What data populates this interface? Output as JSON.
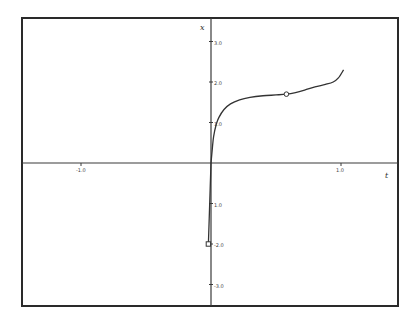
{
  "chart_data": {
    "type": "line",
    "title": "",
    "xlabel": "t",
    "ylabel": "x",
    "xlim": [
      -1.6,
      1.45
    ],
    "ylim": [
      -3.3,
      3.5
    ],
    "grid": false,
    "legend": null,
    "x_ticks": [
      {
        "value": -1.0,
        "label": "-1.0"
      },
      {
        "value": 1.0,
        "label": "1.0"
      }
    ],
    "y_ticks": [
      {
        "value": 3.0,
        "label": "3.0"
      },
      {
        "value": 2.0,
        "label": "2.0"
      },
      {
        "value": 1.0,
        "label": "1.0"
      },
      {
        "value": -1.0,
        "label": "1.0"
      },
      {
        "value": -2.0,
        "label": "-2.0"
      },
      {
        "value": -3.0,
        "label": "-3.0"
      }
    ],
    "series": [
      {
        "name": "upper branch",
        "x": [
          0.0,
          0.01,
          0.02,
          0.04,
          0.06,
          0.1,
          0.15,
          0.22,
          0.3,
          0.4,
          0.5,
          0.58,
          0.65,
          0.72,
          0.8,
          0.88,
          0.94,
          0.98,
          1.02
        ],
        "values": [
          0.0,
          0.35,
          0.65,
          0.95,
          1.12,
          1.32,
          1.46,
          1.56,
          1.62,
          1.66,
          1.68,
          1.7,
          1.74,
          1.8,
          1.88,
          1.94,
          2.0,
          2.1,
          2.3
        ]
      },
      {
        "name": "lower branch",
        "x": [
          0.0,
          -0.01,
          -0.02
        ],
        "values": [
          0.0,
          -1.0,
          -2.0
        ]
      }
    ],
    "markers": [
      {
        "shape": "circle",
        "x": 0.58,
        "y": 1.7
      },
      {
        "shape": "square",
        "x": -0.02,
        "y": -2.0
      }
    ]
  },
  "labels": {
    "x_axis": "t",
    "y_axis": "x"
  }
}
